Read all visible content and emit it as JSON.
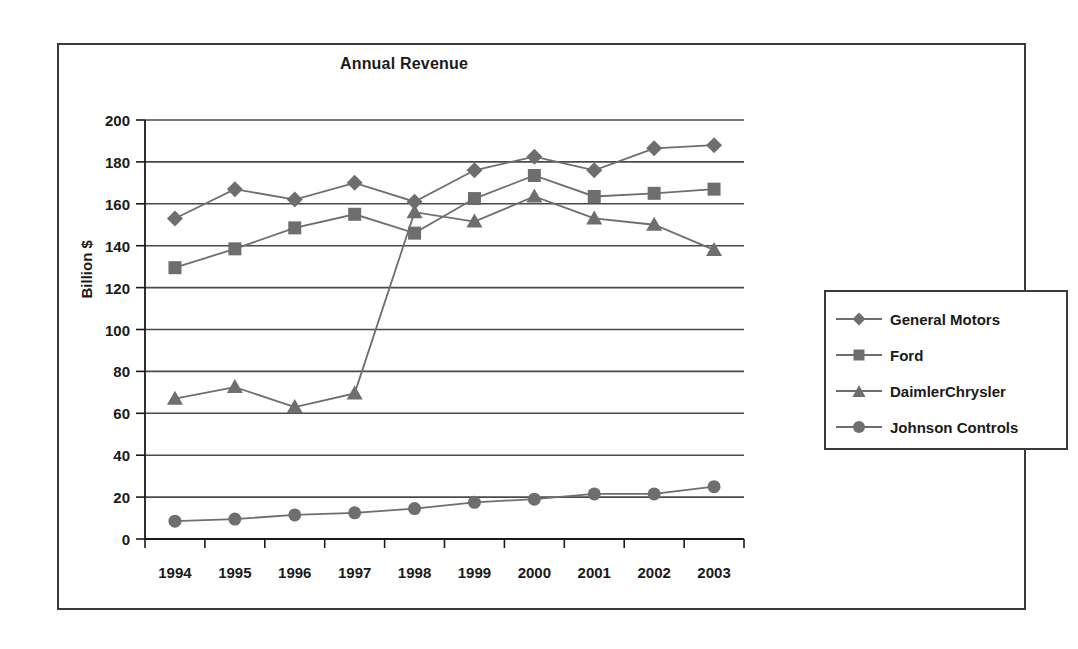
{
  "chart_data": {
    "type": "line",
    "title": "Annual Revenue",
    "xlabel": "",
    "ylabel": "Billion $",
    "categories": [
      "1994",
      "1995",
      "1996",
      "1997",
      "1998",
      "1999",
      "2000",
      "2001",
      "2002",
      "2003"
    ],
    "ylim": [
      0,
      200
    ],
    "yticks": [
      0,
      20,
      40,
      60,
      80,
      100,
      120,
      140,
      160,
      180,
      200
    ],
    "grid": true,
    "legend_position": "right",
    "series": [
      {
        "name": "General Motors",
        "marker": "diamond",
        "color": "#6e6e6e",
        "values": [
          153,
          167,
          162,
          170,
          161,
          176,
          182.5,
          176,
          186.5,
          188
        ]
      },
      {
        "name": "Ford",
        "marker": "square",
        "color": "#6e6e6e",
        "values": [
          129.5,
          138.5,
          148.5,
          155,
          146,
          162.5,
          173.5,
          163.5,
          165,
          167
        ]
      },
      {
        "name": "DaimlerChrysler",
        "marker": "triangle",
        "color": "#6e6e6e",
        "values": [
          67,
          72.5,
          63,
          69.5,
          156,
          151.5,
          163.5,
          153,
          150,
          138
        ]
      },
      {
        "name": "Johnson Controls",
        "marker": "circle",
        "color": "#6e6e6e",
        "values": [
          8.5,
          9.5,
          11.5,
          12.5,
          14.5,
          17.5,
          19,
          21.5,
          21.5,
          25
        ]
      }
    ]
  },
  "colors": {
    "series": "#6e6e6e",
    "axis": "#1a1a1a",
    "grid": "#4a4a4a",
    "frame": "#3a3a3a",
    "background": "#ffffff"
  }
}
